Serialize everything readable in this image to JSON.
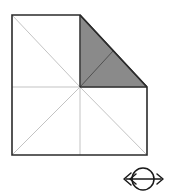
{
  "figure": {
    "title": "Folded square geometry diagram",
    "background_color": "#ffffff",
    "outline_color": "#2b2b2b",
    "thin_line_color": "#b4b4b4",
    "shaded_fill_color": "#8a8a8a",
    "shaded_edge_color": "#2b2b2b",
    "outline_width": 1.6,
    "thin_line_width": 0.8,
    "square": {
      "left": 12,
      "top": 15,
      "right": 147,
      "bottom": 155,
      "center_x": 80,
      "center_y": 87
    },
    "outer_path_points": "12,15 80,15 147,87 147,155 12,155",
    "shaded_triangle": {
      "label": "shaded-triangle",
      "points": "80,15 147,87 80,87"
    },
    "grid_lines": [
      {
        "name": "vertical-midline",
        "x1": 80,
        "y1": 15,
        "x2": 80,
        "y2": 155
      },
      {
        "name": "horizontal-midline",
        "x1": 12,
        "y1": 87,
        "x2": 147,
        "y2": 87
      }
    ],
    "diagonal_lines": [
      {
        "name": "diagonal-upper-left",
        "x1": 12,
        "y1": 15,
        "x2": 80,
        "y2": 87
      },
      {
        "name": "diagonal-lower-left",
        "x1": 12,
        "y1": 155,
        "x2": 80,
        "y2": 87
      },
      {
        "name": "diagonal-lower-right",
        "x1": 147,
        "y1": 155,
        "x2": 80,
        "y2": 87
      },
      {
        "name": "diagonal-shaded-interior",
        "x1": 80,
        "y1": 87,
        "x2": 113,
        "y2": 51
      }
    ]
  },
  "eye_symbol": {
    "name": "eye-double-arrow-symbol",
    "stroke_color": "#1a1a1a",
    "center_x": 143,
    "center_y": 179,
    "ellipse_rx": 11,
    "ellipse_ry": 11,
    "shaft_left_x": 124,
    "shaft_right_x": 163,
    "description": "Eye with horizontal double-headed arrow"
  }
}
